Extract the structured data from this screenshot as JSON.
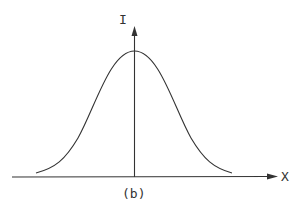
{
  "diagram": {
    "type": "gaussian-intensity-profile",
    "y_axis_label": "I",
    "x_axis_label": "X",
    "caption": "(b)",
    "stroke_color": "#333333"
  }
}
